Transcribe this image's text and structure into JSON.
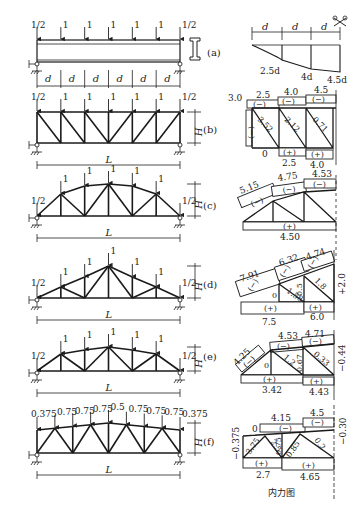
{
  "figure": {
    "caption": "内力图",
    "panels": [
      {
        "id": "a",
        "tag": "(a)",
        "type": "beam",
        "loads": [
          "1/2",
          "1",
          "1",
          "1",
          "1",
          "1",
          "1/2"
        ],
        "panel_label": "d",
        "panels_count": 6,
        "section_icon": "i-beam-icon",
        "moment_diagram": {
          "dims": [
            "d",
            "d",
            "d"
          ],
          "values": [
            "2.5d",
            "4d",
            "4.5d"
          ],
          "symmetry_icon": "symmetry-axis-icon"
        }
      },
      {
        "id": "b",
        "tag": "(b)",
        "type": "parallel-chord",
        "loads": [
          "1/2",
          "1",
          "1",
          "1",
          "1",
          "1",
          "1/2"
        ],
        "height_label": "H",
        "span_label": "L",
        "forces": {
          "top_chord": [
            "2.5",
            "4.0",
            "4.5"
          ],
          "top_sign": [
            "(−)",
            "(−)",
            "(−)"
          ],
          "bottom_chord": [
            "0",
            "2.5",
            "4.0"
          ],
          "bottom_sign": [
            "(+)",
            "(+)"
          ],
          "end_post": "3.0",
          "end_post_sign": "(−)",
          "diagonals": [
            "3.52",
            "2.12",
            "0.71"
          ]
        }
      },
      {
        "id": "c",
        "tag": "(c)",
        "type": "arched",
        "loads": [
          "1/2",
          "1",
          "1",
          "1",
          "1",
          "1",
          "1/2"
        ],
        "height_label": "H",
        "span_label": "L",
        "forces": {
          "top_chord": [
            "5.15",
            "4.75",
            "4.53"
          ],
          "top_sign": [
            "(−)",
            "(−)",
            "(−)"
          ],
          "bottom_chord": "4.50",
          "bottom_sign": "(+)"
        }
      },
      {
        "id": "d",
        "tag": "(d)",
        "type": "triangular",
        "loads": [
          "1/2",
          "1",
          "1",
          "1",
          "1",
          "1",
          "1/2"
        ],
        "height_label": "H",
        "span_label": "L",
        "forces": {
          "top_chord": [
            "7.91",
            "6.32",
            "4.74"
          ],
          "top_sign": [
            "(−)",
            "(−)",
            "(−)"
          ],
          "bottom_chord": [
            "7.5",
            "6.0"
          ],
          "bottom_sign": [
            "(+)",
            "(+)"
          ],
          "verticals": [
            "0",
            "0.5"
          ],
          "diagonals": [
            "1.58",
            "1.8"
          ],
          "center_post": "+2.0"
        }
      },
      {
        "id": "e",
        "tag": "(e)",
        "type": "trapezoidal",
        "loads": [
          "1/2",
          "1",
          "1",
          "1",
          "1",
          "1",
          "1/2"
        ],
        "height_label": "H",
        "span_label": "L",
        "forces": {
          "top_chord": [
            "4.25",
            "4.53",
            "4.71"
          ],
          "top_sign": [
            "(−)",
            "(−)",
            "(−)"
          ],
          "bottom_chord": [
            "3.42",
            "4.43"
          ],
          "bottom_sign": [
            "(+)",
            "(+)"
          ],
          "verticals": [
            "0",
            "0.67"
          ],
          "diagonals": [
            "1.2",
            "0.33"
          ],
          "center_post": "−0.44"
        }
      },
      {
        "id": "f",
        "tag": "(f)",
        "type": "warren-sloped",
        "loads": [
          "0.375",
          "0.75",
          "0.75",
          "0.75",
          "0.5",
          "0.75",
          "0.75",
          "0.75",
          "0.375"
        ],
        "height_label": "H",
        "span_label": "L",
        "forces": {
          "top_chord": [
            "0",
            "4.15",
            "4.5"
          ],
          "top_sign": [
            "(−)",
            "(−)"
          ],
          "bottom_chord": [
            "2.7",
            "4.65"
          ],
          "bottom_sign": [
            "(+)",
            "(+)"
          ],
          "end_post": "−0.375",
          "verticals": [
            "0.75"
          ],
          "diagonals": [
            "3.75",
            "2.5",
            "0.85",
            "0.2"
          ],
          "center_post": "−0.30"
        }
      }
    ]
  }
}
